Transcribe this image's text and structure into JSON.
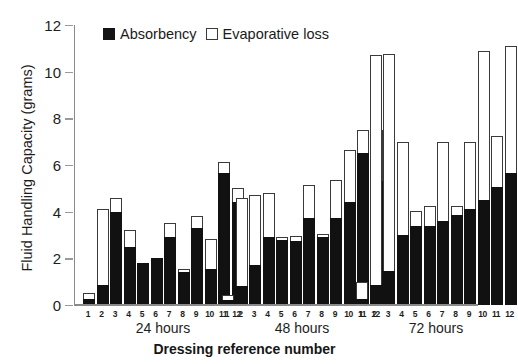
{
  "chart_data": {
    "type": "bar",
    "subtype": "stacked-grouped",
    "title": "",
    "xlabel": "Dressing reference number",
    "ylabel": "Fluid Handling Capacity (grams)",
    "ylim": [
      0,
      12
    ],
    "yticks": [
      0,
      2,
      4,
      6,
      8,
      10,
      12
    ],
    "ytick_labels": [
      "0",
      "2",
      "4",
      "6",
      "8",
      "10",
      "12"
    ],
    "grid": false,
    "legend_position": "top-left-inside",
    "categories": [
      "1",
      "2",
      "3",
      "4",
      "5",
      "6",
      "7",
      "8",
      "9",
      "10",
      "11",
      "12"
    ],
    "groups": [
      "24 hours",
      "48 hours",
      "72 hours"
    ],
    "legend": [
      "Absorbency",
      "Evaporative loss"
    ],
    "series": [
      {
        "name": "Absorbency",
        "color": "#111111",
        "values_by_group": {
          "24 hours": [
            0.25,
            0.85,
            4.0,
            2.5,
            1.8,
            2.0,
            2.9,
            1.4,
            3.3,
            1.55,
            5.65,
            4.4
          ],
          "48 hours": [
            0.2,
            0.8,
            1.7,
            2.9,
            2.8,
            2.75,
            3.75,
            2.9,
            3.75,
            4.4,
            6.5,
            5.3
          ],
          "72 hours": [
            0.25,
            0.85,
            1.45,
            3.0,
            3.4,
            3.4,
            3.6,
            3.85,
            4.1,
            4.5,
            5.05,
            5.65
          ]
        }
      },
      {
        "name": "Evaporative loss",
        "color": "#ffffff",
        "values_by_group": {
          "24 hours": [
            0.25,
            3.25,
            0.6,
            0.7,
            0.0,
            0.0,
            0.6,
            0.15,
            0.5,
            1.3,
            0.5,
            0.6
          ],
          "48 hours": [
            0.25,
            3.8,
            3.0,
            1.9,
            0.1,
            0.2,
            1.4,
            0.05,
            1.6,
            2.25,
            1.0,
            2.2
          ],
          "72 hours": [
            0.75,
            9.85,
            9.3,
            4.0,
            0.65,
            0.85,
            3.4,
            0.4,
            2.9,
            6.4,
            2.2,
            5.45
          ]
        }
      }
    ],
    "totals_by_group": {
      "24 hours": [
        0.5,
        4.1,
        4.6,
        3.2,
        1.8,
        2.0,
        3.5,
        1.55,
        3.8,
        2.85,
        6.15,
        5.0
      ],
      "48 hours": [
        0.45,
        4.6,
        4.7,
        4.8,
        2.9,
        2.95,
        5.15,
        2.95,
        5.35,
        6.65,
        7.5,
        7.5
      ],
      "72 hours": [
        1.0,
        10.7,
        10.75,
        7.0,
        4.05,
        4.25,
        7.0,
        4.25,
        7.0,
        10.9,
        7.25,
        11.1
      ]
    }
  },
  "axis": {
    "y_title": "Fluid Handling Capacity (grams)",
    "x_title": "Dressing reference number"
  },
  "legend": {
    "absorbency_label": "Absorbency",
    "evaporative_label": "Evaporative loss"
  },
  "group_labels": [
    "24 hours",
    "48 hours",
    "72 hours"
  ]
}
